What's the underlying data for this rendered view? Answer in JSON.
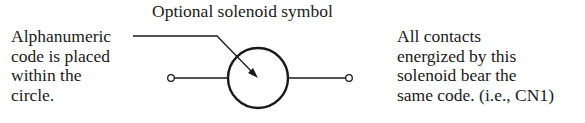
{
  "diagram": {
    "top_label": "Optional solenoid symbol",
    "left_note": {
      "lines": [
        "Alphanumeric",
        "code is placed",
        "within the",
        "circle."
      ]
    },
    "right_note": {
      "lines": [
        "All contacts",
        "energized by this",
        "solenoid bear the",
        "same code. (i.e., CN1)"
      ]
    },
    "symbol": {
      "type": "solenoid-coil",
      "shape": "circle",
      "terminals": [
        "left-terminal",
        "right-terminal"
      ]
    },
    "colors": {
      "ink": "#1a1a1a",
      "background": "#ffffff"
    }
  }
}
